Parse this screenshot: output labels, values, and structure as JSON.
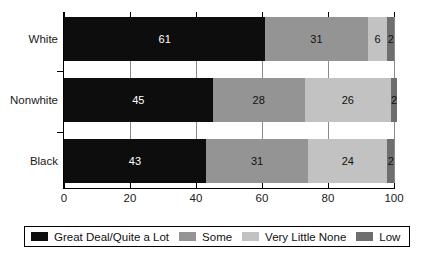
{
  "chart_data": {
    "type": "bar",
    "orientation": "horizontal",
    "stacked": true,
    "title": "",
    "xlabel": "",
    "ylabel": "",
    "xlim": [
      0,
      100
    ],
    "xticks": [
      0,
      20,
      40,
      60,
      80,
      100
    ],
    "grid": true,
    "legend_position": "bottom",
    "categories": [
      "White",
      "Nonwhite",
      "Black"
    ],
    "series": [
      {
        "name": "Great Deal/Quite a Lot",
        "color": "#0d0d0d",
        "values": [
          61,
          45,
          43
        ]
      },
      {
        "name": "Some",
        "color": "#949494",
        "values": [
          31,
          28,
          31
        ]
      },
      {
        "name": "Very Little None",
        "color": "#c2c2c2",
        "values": [
          6,
          26,
          24
        ]
      },
      {
        "name": "Low",
        "color": "#6e6e6e",
        "values": [
          2,
          2,
          2
        ]
      }
    ],
    "bar_labels": {
      "White": [
        "61",
        "31",
        "6",
        "2"
      ],
      "Nonwhite": [
        "45",
        "28",
        "26",
        "2"
      ],
      "Black": [
        "43",
        "31",
        "24",
        "2"
      ]
    }
  },
  "axis": {
    "tick_labels": [
      "0",
      "20",
      "40",
      "60",
      "80",
      "100"
    ]
  },
  "categories": {
    "white": "White",
    "nonwhite": "Nonwhite",
    "black": "Black"
  },
  "legend": {
    "items": [
      {
        "label": "Great Deal/Quite a Lot",
        "color": "#0d0d0d"
      },
      {
        "label": "Some",
        "color": "#949494"
      },
      {
        "label": "Very Little None",
        "color": "#c2c2c2"
      },
      {
        "label": "Low",
        "color": "#6e6e6e"
      }
    ]
  },
  "colors": {
    "axis": "#000000",
    "gridline": "#8a8a8a",
    "label_on_dark": "#ffffff",
    "label_on_light": "#111111",
    "background": "#ffffff"
  }
}
